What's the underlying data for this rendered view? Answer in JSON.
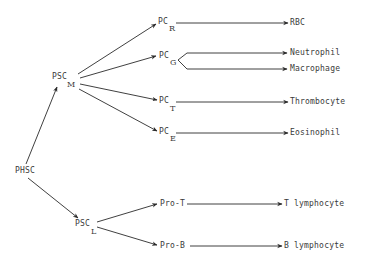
{
  "diagram": {
    "root": {
      "label": "PHSC"
    },
    "stem_cells": [
      {
        "label": "PSC",
        "subscript": "M"
      },
      {
        "label": "PSC",
        "subscript": "L"
      }
    ],
    "progenitors": [
      {
        "label": "PC",
        "subscript": "R",
        "outputs": [
          "RBC"
        ]
      },
      {
        "label": "PC",
        "subscript": "G",
        "outputs": [
          "Neutrophil",
          "Macrophage"
        ]
      },
      {
        "label": "PC",
        "subscript": "T",
        "outputs": [
          "Thrombocyte"
        ]
      },
      {
        "label": "PC",
        "subscript": "E",
        "outputs": [
          "Eosinophil"
        ]
      },
      {
        "label": "Pro-T",
        "subscript": "",
        "outputs": [
          "T lymphocyte"
        ]
      },
      {
        "label": "Pro-B",
        "subscript": "",
        "outputs": [
          "B lymphocyte"
        ]
      }
    ],
    "edges": [
      [
        "PHSC",
        "PSC_M"
      ],
      [
        "PHSC",
        "PSC_L"
      ],
      [
        "PSC_M",
        "PC_R"
      ],
      [
        "PSC_M",
        "PC_G"
      ],
      [
        "PSC_M",
        "PC_T"
      ],
      [
        "PSC_M",
        "PC_E"
      ],
      [
        "PSC_L",
        "Pro-T"
      ],
      [
        "PSC_L",
        "Pro-B"
      ],
      [
        "PC_R",
        "RBC"
      ],
      [
        "PC_G",
        "Neutrophil"
      ],
      [
        "PC_G",
        "Macrophage"
      ],
      [
        "PC_T",
        "Thrombocyte"
      ],
      [
        "PC_E",
        "Eosinophil"
      ],
      [
        "Pro-T",
        "T lymphocyte"
      ],
      [
        "Pro-B",
        "B lymphocyte"
      ]
    ],
    "colors": {
      "line": "#2a2a2a",
      "text": "#3a3a3a",
      "background": "#ffffff"
    }
  }
}
